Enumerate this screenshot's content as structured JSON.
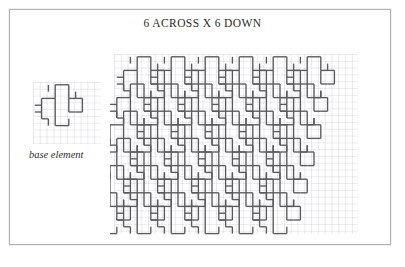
{
  "page": {
    "title": "6 ACROSS X 6 DOWN",
    "background_color": "#ffffff",
    "frame_color": "#b4b4b4"
  },
  "base_element": {
    "caption": "base element",
    "description": "pinwheel-shaped interlocking tile outline drawn on graph paper"
  },
  "diagram": {
    "type": "tessellation",
    "stroke_color": "#59595c",
    "grid_color": "#9696aa",
    "grid_spacing_px": 6.8,
    "tile_unit_px": 6.8,
    "columns": 6,
    "rows": 6,
    "tile_step_x": 34,
    "tile_step_y": 27.2,
    "tile_row_offset_x": -6.8,
    "base_path": "M 13.6 0 L 13.6 13.6 L 27.2 13.6 L 27.2 6.8 L 20.4 6.8 M 27.2 13.6 L 40.8 13.6 L 40.8 27.2 L 34 27.2 L 34 20.4 M 13.6 13.6 L 0 13.6 L 0 0 L 6.8 0 L 6.8 6.8 M 13.6 13.6 L 13.6 27.2 L 0 27.2 L 0 20.4 L 6.8 20.4",
    "legend": []
  }
}
